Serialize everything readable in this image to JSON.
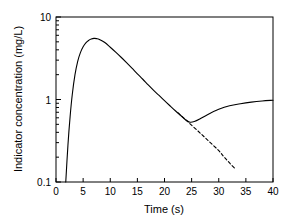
{
  "chart_data": {
    "type": "line",
    "title": "",
    "xlabel": "Time (s)",
    "ylabel": "Indicator concentration (mg/L)",
    "xlim": [
      0,
      40
    ],
    "ylim": [
      0.1,
      10
    ],
    "yscale": "log",
    "xscale": "linear",
    "grid": false,
    "legend": null,
    "xticks": [
      0,
      5,
      10,
      15,
      20,
      25,
      30,
      35,
      40
    ],
    "xtick_labels": [
      "0",
      "5",
      "10",
      "15",
      "20",
      "25",
      "30",
      "35",
      "40"
    ],
    "yticks": [
      0.1,
      1,
      10
    ],
    "ytick_labels": [
      "0.1",
      "1",
      "10"
    ],
    "yminor_ticks": [
      0.2,
      0.3,
      0.4,
      0.5,
      0.6,
      0.7,
      0.8,
      0.9,
      2,
      3,
      4,
      5,
      6,
      7,
      8,
      9
    ],
    "series": [
      {
        "name": "indicator-dilution-curve",
        "style": "solid",
        "color": "#000000",
        "x": [
          1.8,
          2.2,
          2.6,
          3.0,
          3.5,
          4.0,
          4.5,
          5.0,
          5.5,
          6.0,
          6.5,
          7.0,
          7.5,
          8.0,
          9.0,
          10.0,
          11.0,
          12.0,
          13.0,
          14.0,
          15.0,
          16.0,
          17.0,
          18.0,
          19.0,
          20.0,
          21.0,
          22.0,
          23.0,
          24.0,
          24.7,
          25.5,
          26.5,
          28.0,
          30.0,
          32.0,
          34.0,
          36.0,
          38.0,
          40.0
        ],
        "y": [
          0.1,
          0.28,
          0.62,
          1.15,
          2.0,
          2.9,
          3.7,
          4.35,
          4.85,
          5.2,
          5.4,
          5.5,
          5.47,
          5.35,
          4.9,
          4.3,
          3.75,
          3.25,
          2.8,
          2.4,
          2.05,
          1.76,
          1.5,
          1.29,
          1.12,
          0.97,
          0.84,
          0.73,
          0.64,
          0.56,
          0.53,
          0.54,
          0.58,
          0.66,
          0.76,
          0.84,
          0.89,
          0.93,
          0.96,
          0.98
        ]
      },
      {
        "name": "monoexponential-extrapolation",
        "style": "dashed",
        "color": "#000000",
        "x": [
          22.5,
          24.0,
          26.0,
          28.0,
          30.0,
          31.0,
          32.0,
          33.0
        ],
        "y": [
          0.69,
          0.56,
          0.425,
          0.32,
          0.24,
          0.2,
          0.17,
          0.145
        ]
      }
    ],
    "annotations": {
      "peak_time_s": 7.0,
      "peak_value_mg_per_L": 5.5,
      "recirculation_minimum_time_s": 24.7,
      "recirculation_minimum_value_mg_per_L": 0.53,
      "appearance_time_s": 1.8,
      "extrapolation_endpoint_time_s": 33.0
    }
  }
}
